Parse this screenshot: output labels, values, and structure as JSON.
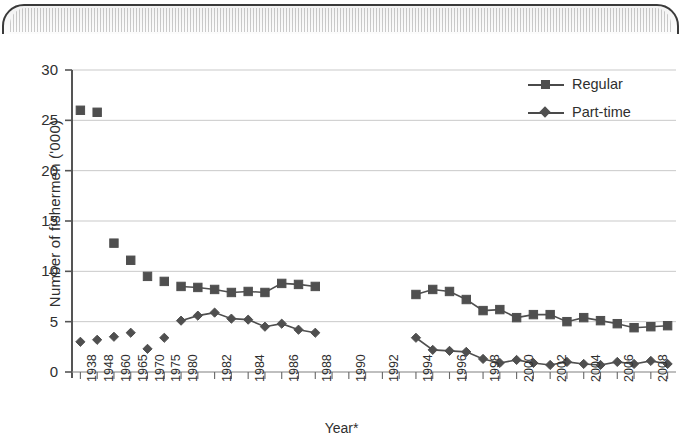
{
  "figure": {
    "y_axis_title": "Number of fishermen ('000)",
    "x_axis_title": "Year*",
    "legend": [
      {
        "label": "Regular",
        "marker": "square-marker-icon",
        "color": "#4f4f4f"
      },
      {
        "label": "Part-time",
        "marker": "diamond-marker-icon",
        "color": "#4f4f4f"
      }
    ]
  },
  "chart_data": {
    "type": "line",
    "title": "",
    "subtitle": "",
    "xlabel": "Year*",
    "ylabel": "Number of fishermen ('000)",
    "ylim": [
      0,
      30
    ],
    "yticks": [
      0,
      5,
      10,
      15,
      20,
      25,
      30
    ],
    "ytick_labels": [
      "0",
      "5",
      "10",
      "15",
      "20",
      "25",
      "30"
    ],
    "grid": "horizontal",
    "legend_position": "top-right",
    "xtick_labels": [
      "1938",
      "1948",
      "1960",
      "1965",
      "1970",
      "1975",
      "1980",
      "1982",
      "1984",
      "1986",
      "1988",
      "1990",
      "1992",
      "1994",
      "1996",
      "1998",
      "2000",
      "2002",
      "2004",
      "2006",
      "2008"
    ],
    "x_categories": [
      "1938",
      "1948",
      "1960",
      "1965",
      "1970",
      "1975",
      "1980",
      "1981",
      "1982",
      "1983",
      "1984",
      "1985",
      "1986",
      "1987",
      "1988",
      "1989",
      "1990",
      "1991",
      "1992",
      "1993",
      "1994",
      "1995",
      "1996",
      "1997",
      "1998",
      "1999",
      "2000",
      "2001",
      "2002",
      "2003",
      "2004",
      "2005",
      "2006",
      "2007",
      "2008",
      "2009"
    ],
    "series": [
      {
        "name": "Regular",
        "marker": "square",
        "color": "#4f4f4f",
        "points": [
          {
            "x": "1938",
            "y": 26.0,
            "connected": false
          },
          {
            "x": "1948",
            "y": 25.8,
            "connected": false
          },
          {
            "x": "1960",
            "y": 12.8,
            "connected": false
          },
          {
            "x": "1965",
            "y": 11.1,
            "connected": false
          },
          {
            "x": "1970",
            "y": 9.5,
            "connected": false
          },
          {
            "x": "1975",
            "y": 9.0,
            "connected": false
          },
          {
            "x": "1980",
            "y": 8.5,
            "connected": true
          },
          {
            "x": "1981",
            "y": 8.4,
            "connected": true
          },
          {
            "x": "1982",
            "y": 8.2,
            "connected": true
          },
          {
            "x": "1983",
            "y": 7.9,
            "connected": true
          },
          {
            "x": "1984",
            "y": 8.0,
            "connected": true
          },
          {
            "x": "1985",
            "y": 7.9,
            "connected": true
          },
          {
            "x": "1986",
            "y": 8.8,
            "connected": true
          },
          {
            "x": "1987",
            "y": 8.7,
            "connected": true
          },
          {
            "x": "1988",
            "y": 8.5,
            "connected": true
          },
          {
            "x": "1994",
            "y": 7.7,
            "connected": true
          },
          {
            "x": "1995",
            "y": 8.2,
            "connected": true
          },
          {
            "x": "1996",
            "y": 8.0,
            "connected": true
          },
          {
            "x": "1997",
            "y": 7.2,
            "connected": true
          },
          {
            "x": "1998",
            "y": 6.1,
            "connected": true
          },
          {
            "x": "1999",
            "y": 6.2,
            "connected": true
          },
          {
            "x": "2000",
            "y": 5.4,
            "connected": true
          },
          {
            "x": "2001",
            "y": 5.7,
            "connected": true
          },
          {
            "x": "2002",
            "y": 5.7,
            "connected": true
          },
          {
            "x": "2003",
            "y": 5.0,
            "connected": true
          },
          {
            "x": "2004",
            "y": 5.4,
            "connected": true
          },
          {
            "x": "2005",
            "y": 5.1,
            "connected": true
          },
          {
            "x": "2006",
            "y": 4.8,
            "connected": true
          },
          {
            "x": "2007",
            "y": 4.4,
            "connected": true
          },
          {
            "x": "2008",
            "y": 4.5,
            "connected": true
          },
          {
            "x": "2009",
            "y": 4.6,
            "connected": true
          }
        ]
      },
      {
        "name": "Part-time",
        "marker": "diamond",
        "color": "#4f4f4f",
        "points": [
          {
            "x": "1938",
            "y": 3.0,
            "connected": false
          },
          {
            "x": "1948",
            "y": 3.2,
            "connected": false
          },
          {
            "x": "1960",
            "y": 3.5,
            "connected": false
          },
          {
            "x": "1965",
            "y": 3.9,
            "connected": false
          },
          {
            "x": "1970",
            "y": 2.3,
            "connected": false
          },
          {
            "x": "1975",
            "y": 3.4,
            "connected": false
          },
          {
            "x": "1980",
            "y": 5.1,
            "connected": true
          },
          {
            "x": "1981",
            "y": 5.6,
            "connected": true
          },
          {
            "x": "1982",
            "y": 5.9,
            "connected": true
          },
          {
            "x": "1983",
            "y": 5.3,
            "connected": true
          },
          {
            "x": "1984",
            "y": 5.2,
            "connected": true
          },
          {
            "x": "1985",
            "y": 4.5,
            "connected": true
          },
          {
            "x": "1986",
            "y": 4.8,
            "connected": true
          },
          {
            "x": "1987",
            "y": 4.2,
            "connected": true
          },
          {
            "x": "1988",
            "y": 3.9,
            "connected": true
          },
          {
            "x": "1994",
            "y": 3.4,
            "connected": true
          },
          {
            "x": "1995",
            "y": 2.2,
            "connected": true
          },
          {
            "x": "1996",
            "y": 2.1,
            "connected": true
          },
          {
            "x": "1997",
            "y": 2.0,
            "connected": true
          },
          {
            "x": "1998",
            "y": 1.3,
            "connected": true
          },
          {
            "x": "1999",
            "y": 0.9,
            "connected": true
          },
          {
            "x": "2000",
            "y": 1.2,
            "connected": true
          },
          {
            "x": "2001",
            "y": 0.9,
            "connected": true
          },
          {
            "x": "2002",
            "y": 0.7,
            "connected": true
          },
          {
            "x": "2003",
            "y": 1.0,
            "connected": true
          },
          {
            "x": "2004",
            "y": 0.8,
            "connected": true
          },
          {
            "x": "2005",
            "y": 0.7,
            "connected": true
          },
          {
            "x": "2006",
            "y": 1.0,
            "connected": true
          },
          {
            "x": "2007",
            "y": 0.8,
            "connected": true
          },
          {
            "x": "2008",
            "y": 1.1,
            "connected": true
          },
          {
            "x": "2009",
            "y": 0.8,
            "connected": true
          }
        ]
      }
    ]
  }
}
